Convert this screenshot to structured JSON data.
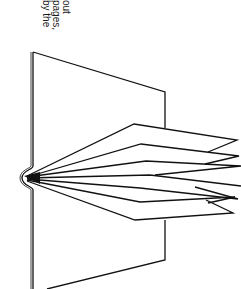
{
  "caption": {
    "lines": [
      "out",
      "pages,",
      "by the"
    ]
  },
  "figure": {
    "stroke_color": "#111111",
    "background_color": "#ffffff",
    "page_count_drawn": 7
  }
}
